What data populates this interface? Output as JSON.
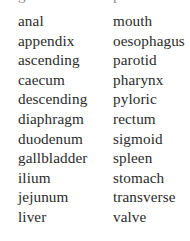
{
  "page": {
    "kind": "two-column-word-list",
    "background_color": "#ffffff",
    "text_color": "#2b2b2b",
    "clipped_top_row": {
      "left_fragment": "gallbladder",
      "right_fragment": "pancreas"
    }
  },
  "columns": {
    "left": {
      "words": [
        "anal",
        "appendix",
        "ascending",
        "caecum",
        "descending",
        "diaphragm",
        "duodenum",
        "gallbladder",
        "ilium",
        "jejunum",
        "liver"
      ]
    },
    "right": {
      "words": [
        "mouth",
        "oesophagus",
        "parotid",
        "pharynx",
        "pyloric",
        "rectum",
        "sigmoid",
        "spleen",
        "stomach",
        "transverse",
        "valve"
      ]
    }
  }
}
